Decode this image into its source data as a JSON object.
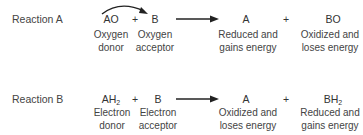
{
  "reactions": [
    {
      "label": "Reaction A",
      "reactant1": {
        "formula": "AO",
        "sub": "",
        "desc1": "Oxygen",
        "desc2": "donor"
      },
      "plus1": "+",
      "reactant2": {
        "formula": "B",
        "sub": "",
        "desc1": "Oxygen",
        "desc2": "acceptor"
      },
      "product1": {
        "formula": "A",
        "sub": "",
        "desc1": "Reduced and",
        "desc2": "gains energy"
      },
      "plus2": "+",
      "product2": {
        "formula": "BO",
        "sub": "",
        "desc1": "Oxidized and",
        "desc2": "loses energy"
      },
      "transfer_arrow": "curved arrow from AO to B"
    },
    {
      "label": "Reaction B",
      "reactant1": {
        "formula": "AH",
        "sub": "2",
        "desc1": "Electron",
        "desc2": "donor"
      },
      "plus1": "+",
      "reactant2": {
        "formula": "B",
        "sub": "",
        "desc1": "Electron",
        "desc2": "acceptor"
      },
      "product1": {
        "formula": "A",
        "sub": "",
        "desc1": "Oxidized and",
        "desc2": "loses energy"
      },
      "plus2": "+",
      "product2": {
        "formula": "BH",
        "sub": "2",
        "desc1": "Reduced and",
        "desc2": "gains energy"
      }
    }
  ]
}
